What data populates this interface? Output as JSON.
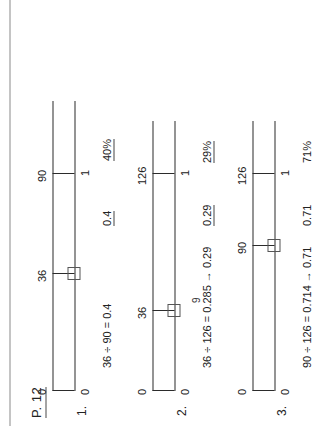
{
  "page": {
    "label": "P. 12"
  },
  "problems": [
    {
      "number": "1.",
      "upper_labels": [
        "0",
        "36",
        "90"
      ],
      "lower_labels": [
        "0",
        "1"
      ],
      "work": "36 ÷ 90 = 0.4",
      "answer_decimal": "0.4",
      "answer_percent": "40%",
      "box_marker": "□",
      "extra": ""
    },
    {
      "number": "2.",
      "upper_labels": [
        "0",
        "36",
        "126"
      ],
      "lower_labels": [
        "0",
        "1"
      ],
      "work": "36 ÷ 126 = 0.285 → 0.29",
      "answer_decimal": "0.29",
      "answer_percent": "29%",
      "box_marker": "□",
      "extra": "9"
    },
    {
      "number": "3.",
      "upper_labels": [
        "0",
        "90",
        "126"
      ],
      "lower_labels": [
        "0",
        "1"
      ],
      "work": "90 ÷ 126 = 0.714 → 0.71",
      "answer_decimal": "0.71",
      "answer_percent": "71%",
      "box_marker": "□",
      "extra": ""
    }
  ]
}
